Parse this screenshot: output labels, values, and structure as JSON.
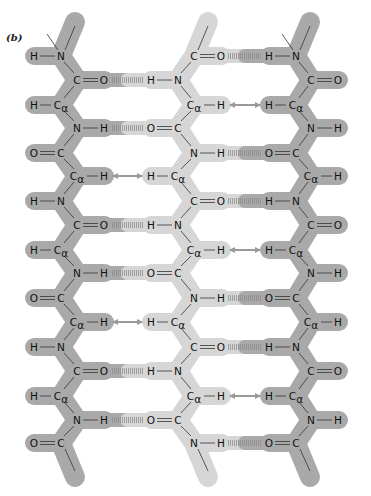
{
  "figure": {
    "panel_label": "(b)"
  },
  "colors": {
    "outer_strand": "#a9a9a9",
    "middle_strand": "#d6d6d6",
    "bond_line": "#333333",
    "text": "#111111",
    "diag_arrow": "#4d4d4d",
    "horiz_arrow": "#9a9a9a"
  },
  "row_y": [
    56,
    80,
    105,
    128,
    153,
    176,
    201,
    225,
    250,
    273,
    298,
    322,
    347,
    371,
    396,
    420,
    443
  ],
  "strands": [
    {
      "name": "left-strand",
      "shade": "outer",
      "spine_x": [
        61,
        77
      ],
      "pattern": [
        "H-N",
        "C=O",
        "H-Ca",
        "N-H",
        "O=C",
        "Ca-H"
      ],
      "groups": [
        {
          "left": "H",
          "right": "N",
          "bond": "single",
          "pos": "inner"
        },
        {
          "left": "C",
          "right": "O",
          "bond": "double",
          "pos": "outer"
        },
        {
          "left": "H",
          "right": "Cα",
          "bond": "single",
          "pos": "inner"
        },
        {
          "left": "N",
          "right": "H",
          "bond": "single",
          "pos": "outer"
        },
        {
          "left": "O",
          "right": "C",
          "bond": "double",
          "pos": "inner"
        },
        {
          "left": "Cα",
          "right": "H",
          "bond": "single",
          "pos": "outer"
        }
      ]
    },
    {
      "name": "middle-strand",
      "shade": "middle",
      "spine_x": [
        178,
        194
      ],
      "groups": [
        {
          "left": "C",
          "right": "O",
          "bond": "double",
          "pos": "outer"
        },
        {
          "left": "H",
          "right": "N",
          "bond": "single",
          "pos": "inner"
        },
        {
          "left": "Cα",
          "right": "H",
          "bond": "single",
          "pos": "outer"
        },
        {
          "left": "O",
          "right": "C",
          "bond": "double",
          "pos": "inner"
        },
        {
          "left": "N",
          "right": "H",
          "bond": "single",
          "pos": "outer"
        },
        {
          "left": "H",
          "right": "Cα",
          "bond": "single",
          "pos": "inner"
        }
      ]
    },
    {
      "name": "right-strand",
      "shade": "outer",
      "spine_x": [
        296,
        311
      ],
      "groups": [
        {
          "left": "H",
          "right": "N",
          "bond": "single",
          "pos": "inner"
        },
        {
          "left": "C",
          "right": "O",
          "bond": "double",
          "pos": "outer"
        },
        {
          "left": "H",
          "right": "Cα",
          "bond": "single",
          "pos": "inner"
        },
        {
          "left": "N",
          "right": "H",
          "bond": "single",
          "pos": "outer"
        },
        {
          "left": "O",
          "right": "C",
          "bond": "double",
          "pos": "inner"
        },
        {
          "left": "Cα",
          "right": "H",
          "bond": "single",
          "pos": "outer"
        }
      ]
    }
  ],
  "legend_atoms": [
    "H",
    "N",
    "C",
    "O",
    "Cα"
  ],
  "arrows_note": "Dark double-headed diagonal arrows and light horizontal double-headed arrows indicate side-chain/Cα-H interactions; striped bars indicate N-H···O=C hydrogen bonds"
}
